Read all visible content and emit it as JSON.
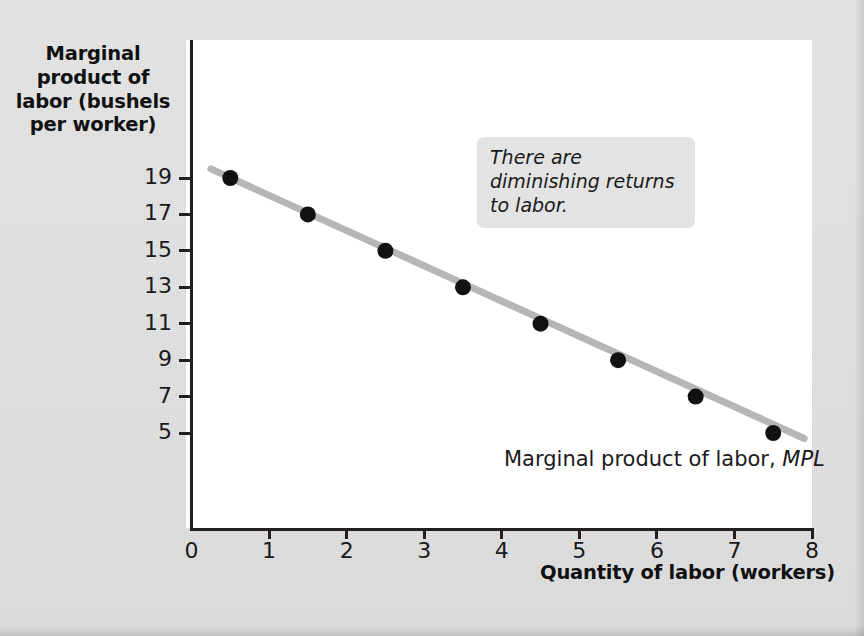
{
  "figure": {
    "y_axis_title": "Marginal product of labor (bushels per worker)",
    "x_axis_title": "Quantity of labor (workers)",
    "callout_text": "There are diminishing returns to labor.",
    "curve_label_text": "Marginal product of labor, ",
    "curve_label_symbol": "MPL",
    "colors": {
      "line": "#b6b6b6",
      "point": "#111111",
      "axis": "#231f20",
      "callout_bg": "#e3e3e3",
      "plot_bg": "#ffffff",
      "page_bg": "#e2e2e2"
    }
  },
  "chart_data": {
    "type": "line",
    "title": "",
    "xlabel": "Quantity of labor (workers)",
    "ylabel": "Marginal product of labor (bushels per worker)",
    "xlim": [
      0,
      8
    ],
    "ylim": [
      0,
      20
    ],
    "grid": false,
    "legend": "none",
    "x_ticks": [
      "0",
      "1",
      "2",
      "3",
      "4",
      "5",
      "6",
      "7",
      "8"
    ],
    "x_tick_values": [
      0,
      1,
      2,
      3,
      4,
      5,
      6,
      7,
      8
    ],
    "y_ticks": [
      "19",
      "17",
      "15",
      "13",
      "11",
      "9",
      "7",
      "5"
    ],
    "y_tick_values": [
      19,
      17,
      15,
      13,
      11,
      9,
      7,
      5
    ],
    "series": [
      {
        "name": "Marginal product of labor, MPL",
        "x": [
          0.5,
          1.5,
          2.5,
          3.5,
          4.5,
          5.5,
          6.5,
          7.5
        ],
        "y": [
          19,
          17,
          15,
          13,
          11,
          9,
          7,
          5
        ],
        "marker": "filled-circle",
        "line_extends_from": {
          "x": 0.25,
          "y": 19.5
        },
        "line_extends_to": {
          "x": 7.9,
          "y": 4.7
        }
      }
    ],
    "annotations": [
      {
        "text": "There are diminishing returns to labor.",
        "x": 3.7,
        "y": 17.6
      },
      {
        "text": "Marginal product of labor, MPL",
        "x": 4.1,
        "y": 4.2
      }
    ]
  }
}
